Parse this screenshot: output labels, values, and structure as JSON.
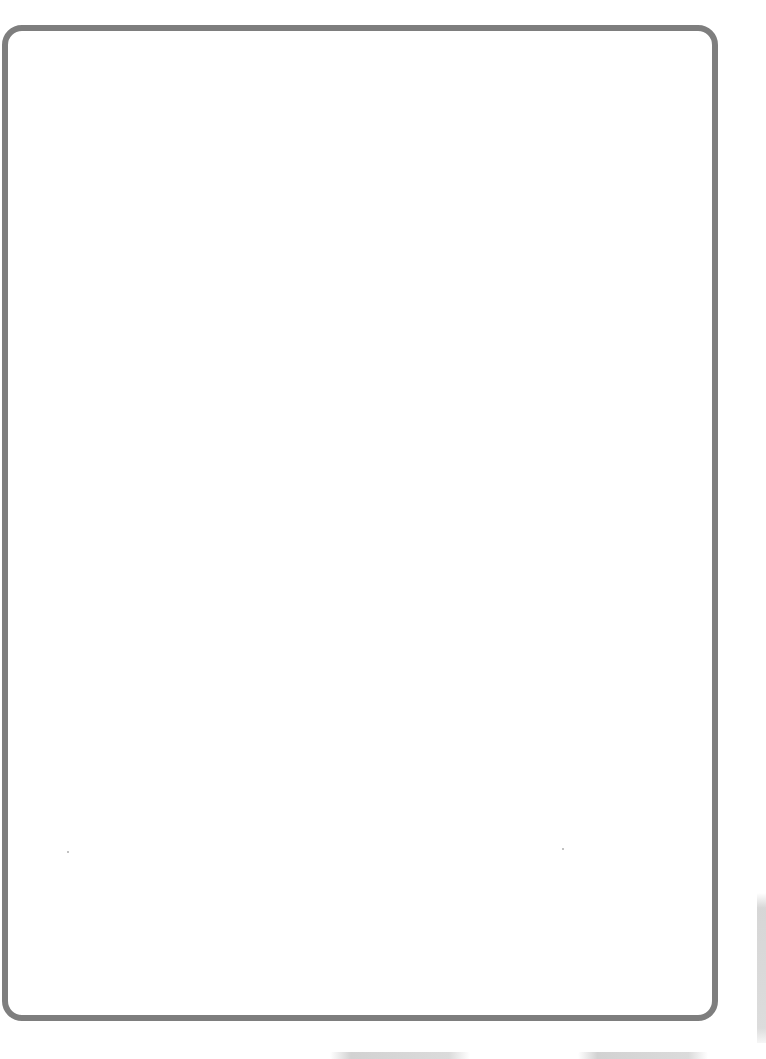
{
  "page": {
    "background_color": "#ffffff",
    "frame": {
      "stroke_color": "#7e7e7e",
      "stroke_width": 6,
      "corner_radius": 20,
      "fill_color": "#ffffff",
      "content": ""
    }
  }
}
